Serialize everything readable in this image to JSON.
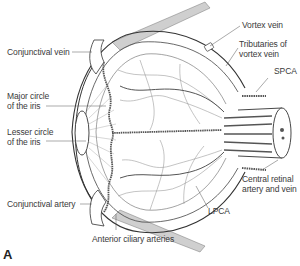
{
  "diagram": {
    "panel_label": "A",
    "labels": {
      "conjunctival_vein": "Conjunctival vein",
      "major_circle_l1": "Major circle",
      "major_circle_l2": "of the iris",
      "lesser_circle_l1": "Lesser circle",
      "lesser_circle_l2": "of the iris",
      "conjunctival_artery": "Conjunctival artery",
      "anterior_ciliary": "Anterior ciliary arteries",
      "lpca": "LPCA",
      "central_retinal_l1": "Central retinal",
      "central_retinal_l2": "artery and vein",
      "spca": "SPCA",
      "tributaries_l1": "Tributaries of",
      "tributaries_l2": "vortex vein",
      "vortex_vein": "Vortex vein"
    },
    "colors": {
      "line": "#3a3a3a",
      "vessel": "#555555",
      "muscle": "#bdbdbd",
      "background": "#ffffff"
    }
  }
}
